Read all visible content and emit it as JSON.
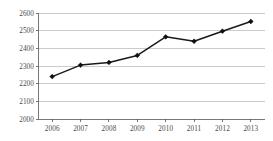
{
  "chart_data": {
    "type": "line",
    "title": "",
    "subtitle": "",
    "xlabel": "",
    "ylabel": "",
    "categories": [
      "2006",
      "2007",
      "2008",
      "2009",
      "2010",
      "2011",
      "2012",
      "2013"
    ],
    "values": [
      2240,
      2305,
      2320,
      2360,
      2465,
      2440,
      2497,
      2552
    ],
    "series": [
      {
        "name": "",
        "values": [
          2240,
          2305,
          2320,
          2360,
          2465,
          2440,
          2497,
          2552
        ]
      }
    ],
    "ylim": [
      2000,
      2600
    ],
    "yticks": [
      2000,
      2100,
      2200,
      2300,
      2400,
      2500,
      2600
    ],
    "ytick_labels": [
      "2000",
      "2100",
      "2200",
      "2300",
      "2400",
      "2500",
      "2600"
    ],
    "xticks": [
      "2006",
      "2007",
      "2008",
      "2009",
      "2010",
      "2011",
      "2012",
      "2013"
    ],
    "grid": true,
    "grid_axis": "y",
    "legend": false,
    "legend_position": "none",
    "marker": "diamond",
    "line_color": "#1a1a1a",
    "marker_color": "#101010",
    "grid_color": "#a8a8a8",
    "axis_color": "#555555",
    "background_color": "#ffffff",
    "annotations": []
  },
  "layout": {
    "plot_left": 38,
    "plot_right": 265,
    "plot_top": 13,
    "plot_bottom": 119
  }
}
